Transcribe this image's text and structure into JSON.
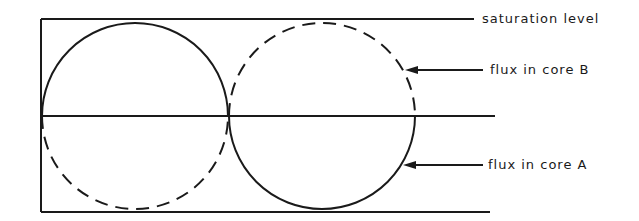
{
  "diagram": {
    "type": "flux waveform diagram",
    "labels": {
      "saturation": "saturation level",
      "core_b": "flux in core B",
      "core_a": "flux in core A"
    },
    "colors": {
      "ink": "#1a1a1a",
      "background": "#ffffff"
    },
    "geometry": {
      "top_line_y": 19,
      "axis_y": 116,
      "bottom_line_y": 212,
      "left_x": 41,
      "circle_radius": 93,
      "circle_centers_x": [
        135,
        322
      ]
    },
    "series": [
      {
        "name": "flux in core A",
        "style": "solid"
      },
      {
        "name": "flux in core B",
        "style": "dashed"
      }
    ]
  }
}
